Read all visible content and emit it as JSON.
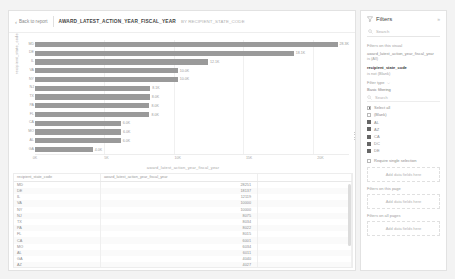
{
  "header": {
    "back_label": "Back to report",
    "title": "AWARD_LATEST_ACTION_YEAR_FISCAL_YEAR",
    "subtitle": "BY RECIPIENT_STATE_CODE"
  },
  "chart_data": {
    "type": "bar",
    "orientation": "horizontal",
    "title": "",
    "xlabel": "award_latest_action_year_fiscal_year",
    "ylabel": "recipient_state_code",
    "categories": [
      "MD",
      "DE",
      "IL",
      "VA",
      "NY",
      "NJ",
      "TX",
      "PA",
      "FL",
      "CA",
      "MO",
      "AL",
      "GA"
    ],
    "values": [
      28251,
      18137,
      12119,
      10000,
      10000,
      8075,
      8034,
      8022,
      8015,
      6001,
      6034,
      6011,
      4040
    ],
    "data_labels": [
      "28.3K",
      "18.1K",
      "12.1K",
      "10.0K",
      "10.0K",
      "8.1K",
      "8.0K",
      "8.0K",
      "8.0K",
      "6.0K",
      "6.0K",
      "6.0K",
      "4.0K"
    ],
    "xticks": [
      "0K",
      "5K",
      "10K",
      "15K",
      "20K"
    ],
    "xlim": [
      0,
      22000
    ],
    "grid": true,
    "legend": "none",
    "bar_color": "#9a9a9a"
  },
  "table": {
    "columns": [
      "recipient_state_code",
      "award_latest_action_year_fiscal_year"
    ],
    "rows": [
      [
        "MD",
        "28251"
      ],
      [
        "DE",
        "18137"
      ],
      [
        "IL",
        "12119"
      ],
      [
        "VA",
        "10000"
      ],
      [
        "NY",
        "10000"
      ],
      [
        "NJ",
        "8075"
      ],
      [
        "TX",
        "8034"
      ],
      [
        "PA",
        "8022"
      ],
      [
        "FL",
        "8015"
      ],
      [
        "CA",
        "6001"
      ],
      [
        "MO",
        "6034"
      ],
      [
        "AL",
        "6011"
      ],
      [
        "GA",
        "4040"
      ],
      [
        "AZ",
        "4027"
      ]
    ]
  },
  "filters": {
    "title": "Filters",
    "collapse_icon": "double-chevron-icon",
    "search_placeholder": "Search",
    "section_visual": "Filters on this visual",
    "visual_field_1": "award_latest_action_year_fiscal_year",
    "visual_field_1_state": "is (All)",
    "visual_field_2": "recipient_state_code",
    "visual_field_2_state": "is not (Blank)",
    "filter_type_label": "Filter type",
    "filter_type_value": "Basic filtering",
    "list_search_placeholder": "Search",
    "checkboxes": [
      {
        "label": "Select all",
        "state": "partial"
      },
      {
        "label": "(Blank)",
        "state": "unchecked"
      },
      {
        "label": "AL",
        "state": "checked"
      },
      {
        "label": "AZ",
        "state": "checked"
      },
      {
        "label": "CA",
        "state": "checked"
      },
      {
        "label": "DC",
        "state": "checked"
      },
      {
        "label": "DE",
        "state": "checked"
      }
    ],
    "require_single": "Require single selection",
    "dropzone_1": "Add data fields here",
    "section_page": "Filters on this page",
    "dropzone_2": "Add data fields here",
    "section_all": "Filters on all pages",
    "dropzone_3": "Add data fields here"
  }
}
